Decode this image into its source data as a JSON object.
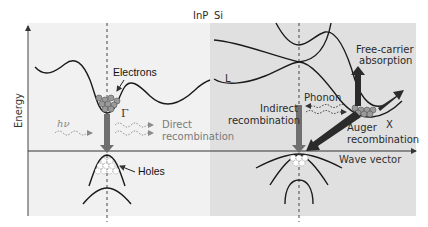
{
  "header": {
    "left_material": "InP",
    "right_material": "Si"
  },
  "axes": {
    "y_label": "Energy",
    "x_label": "Wave vector"
  },
  "left_panel": {
    "material": "InP",
    "electrons_label": "Electrons",
    "holes_label": "Holes",
    "gamma_label": "Γ",
    "photon_label": "hν",
    "process_label_line1": "Direct",
    "process_label_line2": "recombination"
  },
  "right_panel": {
    "material": "Si",
    "L_label": "L",
    "X_label": "X",
    "phonon_label": "Phonon",
    "indirect_line1": "Indirect",
    "indirect_line2": "recombination",
    "auger_line1": "Auger",
    "auger_line2": "recombination",
    "fca_line1": "Free-carrier",
    "fca_line2": "absorption"
  },
  "colors": {
    "left_bg": "#f1f1f1",
    "right_bg": "#e0e0e0",
    "curve": "#1a1a1a",
    "arrow_gray": "#6f6f6f",
    "arrow_dark": "#2b2b2b"
  }
}
